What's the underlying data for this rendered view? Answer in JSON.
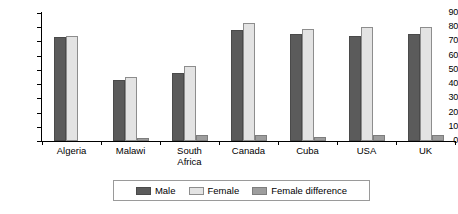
{
  "chart_data": {
    "type": "bar",
    "title": "",
    "subtitle": "",
    "xlabel": "",
    "ylabel": "",
    "ylim": [
      0,
      90
    ],
    "ytick_step": 10,
    "yticks": [
      90,
      80,
      70,
      60,
      50,
      40,
      30,
      20,
      10,
      0
    ],
    "grid": false,
    "legend_position": "bottom",
    "categories": [
      "Algeria",
      "Malawi",
      "South Africa",
      "Canada",
      "Cuba",
      "USA",
      "UK"
    ],
    "category_lines": [
      [
        "Algeria"
      ],
      [
        "Malawi"
      ],
      [
        "South",
        "Africa"
      ],
      [
        "Canada"
      ],
      [
        "Cuba"
      ],
      [
        "USA"
      ],
      [
        "UK"
      ]
    ],
    "series": [
      {
        "name": "Male",
        "color": "#5b5b5b",
        "values": [
          73,
          43,
          48,
          78,
          75,
          74,
          75
        ]
      },
      {
        "name": "Female",
        "color": "#e3e3e3",
        "values": [
          74,
          45,
          53,
          83,
          79,
          80,
          80
        ]
      },
      {
        "name": "Female difference",
        "color": "#9d9d9d",
        "values": [
          0.5,
          2,
          4,
          4,
          3,
          4,
          4
        ]
      }
    ]
  },
  "legend": {
    "items": [
      {
        "label": "Male",
        "swatch": "male"
      },
      {
        "label": "Female",
        "swatch": "female"
      },
      {
        "label": "Female difference",
        "swatch": "diff"
      }
    ]
  }
}
